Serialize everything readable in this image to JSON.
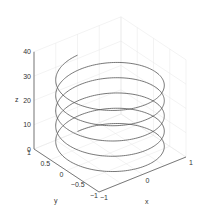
{
  "chart_data": {
    "type": "line3d",
    "title": "",
    "xlabel": "x",
    "ylabel": "y",
    "zlabel": "z",
    "xlim": [
      -1,
      1
    ],
    "ylim": [
      -1,
      1
    ],
    "zlim": [
      0,
      40
    ],
    "x_ticks": [
      "-1",
      "0",
      "1"
    ],
    "y_ticks": [
      "1",
      "0.5",
      "0",
      "-0.5",
      "-1"
    ],
    "z_ticks": [
      "0",
      "10",
      "20",
      "30",
      "40"
    ],
    "grid": true,
    "series": [
      {
        "name": "helix",
        "equation": "x = sin(t), y = cos(t), z = t",
        "t_range": [
          0,
          31.4159
        ],
        "turns": 5,
        "color": "#555555"
      }
    ]
  },
  "colors": {
    "line": "#555555",
    "axis": "#444444",
    "grid": "#e6e6e6"
  }
}
